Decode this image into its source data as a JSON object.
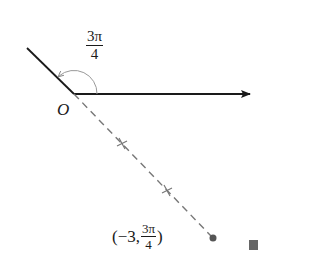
{
  "diagram": {
    "type": "polar-coordinate-point",
    "origin_label": "O",
    "angle_label": {
      "numerator": "3π",
      "denominator": "4"
    },
    "point_label": {
      "prefix": "(−3, ",
      "numerator": "3π",
      "denominator": "4",
      "suffix": ")"
    },
    "polar_point": {
      "r": -3,
      "theta": "3π/4"
    },
    "tick_marks_on_dashed_ray": 2,
    "end_marker": "filled-square"
  },
  "colors": {
    "ink": "#1a1a1a",
    "dashed_ray": "#777777",
    "arc": "#999999",
    "point": "#555555",
    "end_marker": "#666666"
  }
}
